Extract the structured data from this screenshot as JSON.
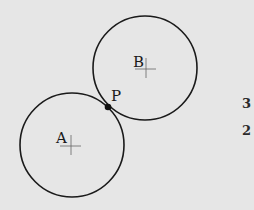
{
  "diagram": {
    "circles": [
      {
        "name": "A",
        "label": "A"
      },
      {
        "name": "B",
        "label": "B"
      }
    ],
    "point": {
      "label": "P",
      "description": "tangent point of circles A and B"
    },
    "side_numbers": [
      "3",
      "2"
    ],
    "colors": {
      "background": "#e6e6e6",
      "stroke": "#1a1a1a",
      "center_mark": "#555555"
    }
  }
}
